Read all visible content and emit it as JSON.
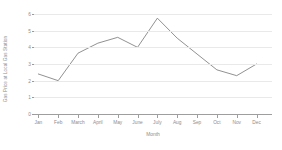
{
  "chart_data": {
    "type": "line",
    "title": "",
    "xlabel": "Month",
    "ylabel": "Gas Price at Local Gas Station",
    "categories": [
      "Jan",
      "Feb",
      "March",
      "April",
      "May",
      "June",
      "July",
      "Aug",
      "Sep",
      "Oct",
      "Nov",
      "Dec"
    ],
    "values": [
      2.4,
      2.0,
      3.65,
      4.25,
      4.6,
      4.0,
      5.75,
      4.55,
      3.6,
      2.65,
      2.3,
      3.0
    ],
    "series": [
      {
        "name": "Gas Price",
        "values": [
          2.4,
          2.0,
          3.65,
          4.25,
          4.6,
          4.0,
          5.75,
          4.55,
          3.6,
          2.65,
          2.3,
          3.0
        ]
      }
    ],
    "ylim": [
      0,
      6
    ],
    "yticks": [
      0,
      1,
      2,
      3,
      4,
      5,
      6
    ],
    "ytick_labels": [
      "0",
      "1",
      "2",
      "3",
      "4",
      "5",
      "6"
    ],
    "grid": true,
    "legend": false,
    "legend_position": "none",
    "line_color": "#7d7d7d",
    "grid_color": "#e9e9e9",
    "axis_color": "#9e9e9e",
    "text_color": "#8d8d8d",
    "background_color": "#ffffff"
  }
}
